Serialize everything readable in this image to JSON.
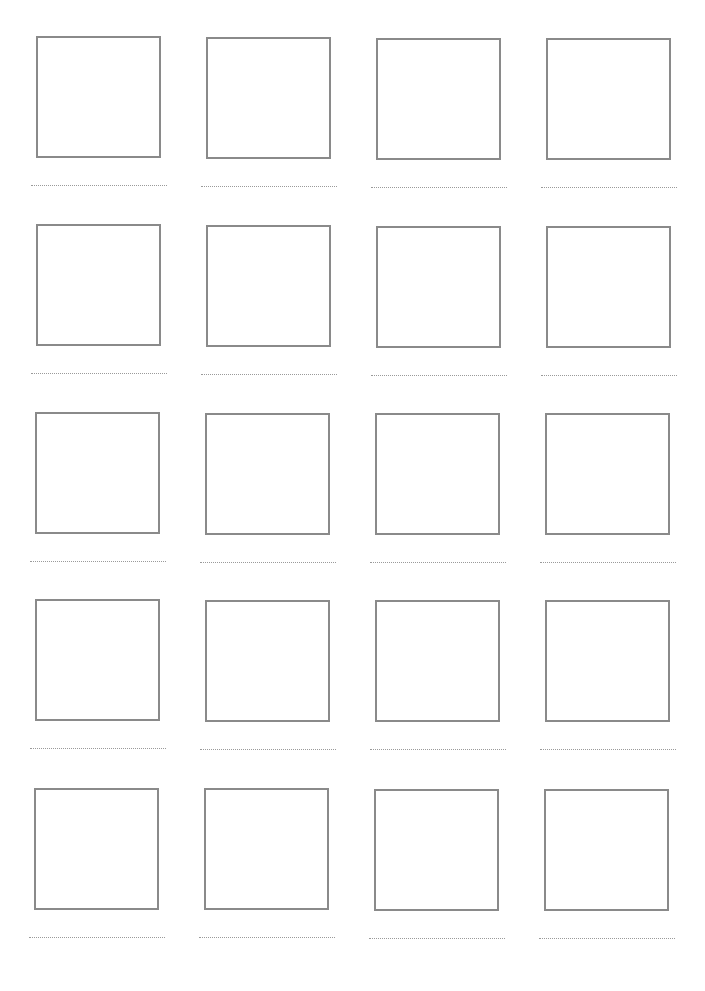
{
  "page": {
    "type": "drawing-worksheet",
    "rows": 5,
    "columns": 4,
    "border_color": "#8a8a8a",
    "line_color": "#9a9a9a"
  },
  "cells": [
    {
      "row": 1,
      "col": 1,
      "x": 36,
      "y": 36
    },
    {
      "row": 1,
      "col": 2,
      "x": 206,
      "y": 37
    },
    {
      "row": 1,
      "col": 3,
      "x": 376,
      "y": 38
    },
    {
      "row": 1,
      "col": 4,
      "x": 546,
      "y": 38
    },
    {
      "row": 2,
      "col": 1,
      "x": 36,
      "y": 224
    },
    {
      "row": 2,
      "col": 2,
      "x": 206,
      "y": 225
    },
    {
      "row": 2,
      "col": 3,
      "x": 376,
      "y": 226
    },
    {
      "row": 2,
      "col": 4,
      "x": 546,
      "y": 226
    },
    {
      "row": 3,
      "col": 1,
      "x": 35,
      "y": 412
    },
    {
      "row": 3,
      "col": 2,
      "x": 205,
      "y": 413
    },
    {
      "row": 3,
      "col": 3,
      "x": 375,
      "y": 413
    },
    {
      "row": 3,
      "col": 4,
      "x": 545,
      "y": 413
    },
    {
      "row": 4,
      "col": 1,
      "x": 35,
      "y": 599
    },
    {
      "row": 4,
      "col": 2,
      "x": 205,
      "y": 600
    },
    {
      "row": 4,
      "col": 3,
      "x": 375,
      "y": 600
    },
    {
      "row": 4,
      "col": 4,
      "x": 545,
      "y": 600
    },
    {
      "row": 5,
      "col": 1,
      "x": 34,
      "y": 788
    },
    {
      "row": 5,
      "col": 2,
      "x": 204,
      "y": 788
    },
    {
      "row": 5,
      "col": 3,
      "x": 374,
      "y": 789
    },
    {
      "row": 5,
      "col": 4,
      "x": 544,
      "y": 789
    }
  ]
}
